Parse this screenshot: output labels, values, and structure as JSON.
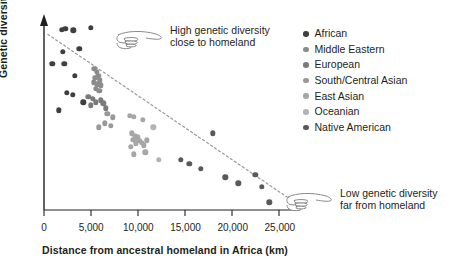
{
  "chart_data": {
    "type": "scatter",
    "title": "",
    "xlabel": "Distance from ancestral homeland in Africa (km)",
    "ylabel": "Genetic diversity",
    "xlim": [
      0,
      26500
    ],
    "ylim": [
      0,
      1
    ],
    "xticks": [
      0,
      5000,
      10000,
      15000,
      20000,
      25000
    ],
    "xticklabels": [
      "0",
      "5,000",
      "10,000",
      "15,000",
      "20,000",
      "25,000"
    ],
    "yticks": [],
    "yticklabels": [],
    "grid": false,
    "legend_position": "right",
    "trendline": {
      "style": "dashed",
      "color": "#9a9a9a",
      "x0": 400,
      "y0": 0.915,
      "x1": 25800,
      "y1": 0.066
    },
    "series": [
      {
        "name": "African",
        "color": "#3f3f3f",
        "points": [
          {
            "x": 1900,
            "y": 0.94
          },
          {
            "x": 2250,
            "y": 0.945
          },
          {
            "x": 3100,
            "y": 0.935
          },
          {
            "x": 4950,
            "y": 0.95
          },
          {
            "x": 2000,
            "y": 0.825
          },
          {
            "x": 3750,
            "y": 0.84
          },
          {
            "x": 900,
            "y": 0.76
          },
          {
            "x": 2150,
            "y": 0.76
          },
          {
            "x": 3250,
            "y": 0.7
          },
          {
            "x": 2400,
            "y": 0.61
          },
          {
            "x": 1600,
            "y": 0.52
          },
          {
            "x": 3050,
            "y": 0.6
          },
          {
            "x": 4150,
            "y": 0.56
          }
        ]
      },
      {
        "name": "Middle Eastern",
        "color": "#8c8c8c",
        "points": [
          {
            "x": 5350,
            "y": 0.735
          },
          {
            "x": 5600,
            "y": 0.72
          },
          {
            "x": 5750,
            "y": 0.7
          },
          {
            "x": 5450,
            "y": 0.688
          },
          {
            "x": 5900,
            "y": 0.676
          },
          {
            "x": 5250,
            "y": 0.665
          },
          {
            "x": 5650,
            "y": 0.655
          },
          {
            "x": 6050,
            "y": 0.65
          },
          {
            "x": 5500,
            "y": 0.632
          },
          {
            "x": 5850,
            "y": 0.62
          }
        ]
      },
      {
        "name": "European",
        "color": "#7a7a7a",
        "points": [
          {
            "x": 4700,
            "y": 0.59
          },
          {
            "x": 5150,
            "y": 0.578
          },
          {
            "x": 5500,
            "y": 0.56
          },
          {
            "x": 6000,
            "y": 0.572
          },
          {
            "x": 6300,
            "y": 0.556
          },
          {
            "x": 4950,
            "y": 0.545
          },
          {
            "x": 6550,
            "y": 0.53
          }
        ]
      },
      {
        "name": "South/Central Asian",
        "color": "#999999",
        "points": [
          {
            "x": 6700,
            "y": 0.5
          },
          {
            "x": 7300,
            "y": 0.482
          },
          {
            "x": 6450,
            "y": 0.452
          },
          {
            "x": 7050,
            "y": 0.44
          },
          {
            "x": 5800,
            "y": 0.43
          }
        ]
      },
      {
        "name": "East Asian",
        "color": "#a6a6a6",
        "points": [
          {
            "x": 9100,
            "y": 0.492
          },
          {
            "x": 9500,
            "y": 0.486
          },
          {
            "x": 10450,
            "y": 0.47
          },
          {
            "x": 9300,
            "y": 0.4
          },
          {
            "x": 9650,
            "y": 0.388
          },
          {
            "x": 9900,
            "y": 0.378
          },
          {
            "x": 9450,
            "y": 0.366
          },
          {
            "x": 10100,
            "y": 0.36
          },
          {
            "x": 9750,
            "y": 0.348
          },
          {
            "x": 10350,
            "y": 0.35
          },
          {
            "x": 10600,
            "y": 0.336
          },
          {
            "x": 9200,
            "y": 0.33
          },
          {
            "x": 10900,
            "y": 0.362
          },
          {
            "x": 10750,
            "y": 0.3
          },
          {
            "x": 9550,
            "y": 0.29
          }
        ]
      },
      {
        "name": "Oceanian",
        "color": "#b3b3b3",
        "points": [
          {
            "x": 11600,
            "y": 0.43
          },
          {
            "x": 12200,
            "y": 0.262
          }
        ]
      },
      {
        "name": "Native American",
        "color": "#595959",
        "points": [
          {
            "x": 14500,
            "y": 0.262
          },
          {
            "x": 15400,
            "y": 0.242
          },
          {
            "x": 16600,
            "y": 0.215
          },
          {
            "x": 17900,
            "y": 0.4
          },
          {
            "x": 19200,
            "y": 0.17
          },
          {
            "x": 20600,
            "y": 0.14
          },
          {
            "x": 22400,
            "y": 0.182
          },
          {
            "x": 23100,
            "y": 0.122
          },
          {
            "x": 23900,
            "y": 0.04
          }
        ]
      }
    ]
  },
  "legend": {
    "items": [
      {
        "label": "African",
        "color": "#3f3f3f"
      },
      {
        "label": "Middle Eastern",
        "color": "#8c8c8c"
      },
      {
        "label": "European",
        "color": "#7a7a7a"
      },
      {
        "label": "South/Central Asian",
        "color": "#999999"
      },
      {
        "label": "East Asian",
        "color": "#a6a6a6"
      },
      {
        "label": "Oceanian",
        "color": "#b3b3b3"
      },
      {
        "label": "Native American",
        "color": "#595959"
      }
    ]
  },
  "annotations": [
    {
      "name": "high-diversity-callout",
      "line1": "High genetic diversity",
      "line2": "close to homeland",
      "icon": "pointing-hand-right-icon"
    },
    {
      "name": "low-diversity-callout",
      "line1": "Low genetic diversity",
      "line2": "far from homeland",
      "icon": "pointing-hand-right-icon"
    }
  ],
  "axes": {
    "x_title": "Distance from ancestral homeland in Africa (km)",
    "y_title": "Genetic diversity"
  }
}
